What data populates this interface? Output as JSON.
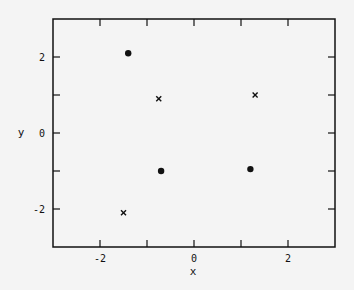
{
  "chart_data": {
    "type": "scatter",
    "title": "",
    "xlabel": "x",
    "ylabel": "y",
    "xlim": [
      -3,
      3
    ],
    "ylim": [
      -3,
      3
    ],
    "xticks": [
      -2,
      -1,
      0,
      1,
      2
    ],
    "xtick_labels": [
      "-2",
      "",
      "0",
      "",
      "2"
    ],
    "yticks": [
      -2,
      -1,
      0,
      1,
      2
    ],
    "ytick_labels": [
      "-2",
      "",
      "0",
      "",
      "2"
    ],
    "grid": false,
    "legend": null,
    "series": [
      {
        "name": "dots",
        "marker": "filled-circle",
        "points": [
          {
            "x": -1.4,
            "y": 2.1
          },
          {
            "x": -0.7,
            "y": -1.0
          },
          {
            "x": 1.2,
            "y": -0.95
          }
        ]
      },
      {
        "name": "crosses",
        "marker": "x",
        "points": [
          {
            "x": -0.75,
            "y": 0.9
          },
          {
            "x": 1.3,
            "y": 1.0
          },
          {
            "x": -1.5,
            "y": -2.1
          }
        ]
      }
    ]
  }
}
